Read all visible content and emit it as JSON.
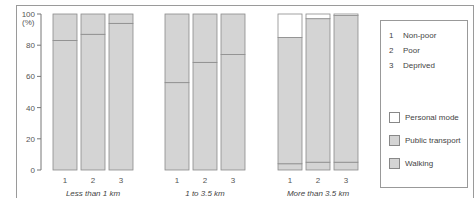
{
  "chart_data": {
    "type": "bar",
    "stacked": true,
    "title": "",
    "xlabel": "",
    "ylabel": "(%)",
    "ylim": [
      0,
      100
    ],
    "yticks": [
      0,
      20,
      40,
      60,
      80,
      100
    ],
    "ytick_labels": [
      "0",
      "20",
      "40",
      "60",
      "80",
      "100"
    ],
    "groups": [
      {
        "label": "Less than 1 km",
        "categories": [
          "1",
          "2",
          "3"
        ]
      },
      {
        "label": "1 to 3.5 km",
        "categories": [
          "1",
          "2",
          "3"
        ]
      },
      {
        "label": "More than 3.5 km",
        "categories": [
          "1",
          "2",
          "3"
        ]
      }
    ],
    "series": [
      {
        "name": "Walking",
        "color": "#d4d4d4",
        "values": [
          83,
          87,
          94,
          56,
          69,
          74,
          4,
          5,
          5
        ]
      },
      {
        "name": "Public transport",
        "color": "#d4d4d4",
        "values": [
          17,
          13,
          6,
          44,
          31,
          26,
          81,
          92,
          94
        ]
      },
      {
        "name": "Personal mode",
        "color": "#ffffff",
        "values": [
          0,
          0,
          0,
          0,
          0,
          0,
          15,
          3,
          1
        ]
      }
    ],
    "legend": {
      "position": "right",
      "category_key": [
        {
          "num": "1",
          "label": "Non-poor"
        },
        {
          "num": "2",
          "label": "Poor"
        },
        {
          "num": "3",
          "label": "Deprived"
        }
      ],
      "entries": [
        {
          "label": "Personal mode",
          "color": "#ffffff"
        },
        {
          "label": "Public transport",
          "color": "#d4d4d4"
        },
        {
          "label": "Walking",
          "color": "#d4d4d4"
        }
      ]
    },
    "grid": false
  }
}
